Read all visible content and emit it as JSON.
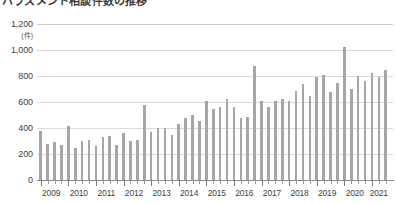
{
  "chart_data": {
    "type": "bar",
    "title": "ハラスメント相談件数の推移",
    "subtitle": "",
    "xlabel": "",
    "ylabel": "",
    "unit_label": "(件)",
    "ylim": [
      0,
      1200
    ],
    "ytick_values": [
      0,
      200,
      400,
      600,
      800,
      1000,
      1200
    ],
    "ytick_labels": [
      "0",
      "200",
      "400",
      "600",
      "800",
      "1,000",
      "1,200"
    ],
    "grid": true,
    "legend": "none",
    "x_axis_type": "quarterly",
    "xtick_labels": [
      "2009",
      "2010",
      "2011",
      "2012",
      "2013",
      "2014",
      "2015",
      "2016",
      "2017",
      "2018",
      "2019",
      "2020",
      "2021"
    ],
    "categories": [
      "2009Q1",
      "2009Q2",
      "2009Q3",
      "2009Q4",
      "2010Q1",
      "2010Q2",
      "2010Q3",
      "2010Q4",
      "2011Q1",
      "2011Q2",
      "2011Q3",
      "2011Q4",
      "2012Q1",
      "2012Q2",
      "2012Q3",
      "2012Q4",
      "2013Q1",
      "2013Q2",
      "2013Q3",
      "2013Q4",
      "2014Q1",
      "2014Q2",
      "2014Q3",
      "2014Q4",
      "2015Q1",
      "2015Q2",
      "2015Q3",
      "2015Q4",
      "2016Q1",
      "2016Q2",
      "2016Q3",
      "2016Q4",
      "2017Q1",
      "2017Q2",
      "2017Q3",
      "2017Q4",
      "2018Q1",
      "2018Q2",
      "2018Q3",
      "2018Q4",
      "2019Q1",
      "2019Q2",
      "2019Q3",
      "2019Q4",
      "2020Q1",
      "2020Q2",
      "2020Q3",
      "2020Q4",
      "2021Q1",
      "2021Q2",
      "2021Q3"
    ],
    "values": [
      380,
      275,
      290,
      270,
      415,
      250,
      300,
      310,
      265,
      330,
      340,
      270,
      360,
      300,
      305,
      575,
      370,
      400,
      400,
      345,
      430,
      475,
      500,
      455,
      605,
      545,
      565,
      625,
      560,
      480,
      485,
      875,
      605,
      565,
      610,
      620,
      610,
      685,
      735,
      650,
      790,
      805,
      680,
      745,
      1020,
      700,
      800,
      760,
      820,
      790,
      850
    ],
    "colors": {
      "bar": "#a6a6a6",
      "grid": "#d9d9d9",
      "axis": "#8c8c8c",
      "text": "#3f3f3f"
    }
  }
}
